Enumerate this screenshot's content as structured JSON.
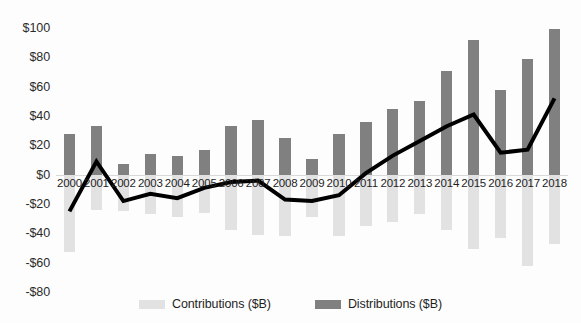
{
  "chart_data": {
    "type": "bar",
    "title": "",
    "xlabel": "",
    "ylabel": "",
    "ylim": [
      -80,
      100
    ],
    "y_ticks": [
      "$100",
      "$80",
      "$60",
      "$40",
      "$20",
      "$0",
      "-$20",
      "-$40",
      "-$60",
      "-$80"
    ],
    "y_tick_values": [
      100,
      80,
      60,
      40,
      20,
      0,
      -20,
      -40,
      -60,
      -80
    ],
    "grid": false,
    "legend_position": "bottom",
    "categories": [
      "2000",
      "2001",
      "2002",
      "2003",
      "2004",
      "2005",
      "2006",
      "2007",
      "2008",
      "2009",
      "2010",
      "2011",
      "2012",
      "2013",
      "2014",
      "2015",
      "2016",
      "2017",
      "2018"
    ],
    "series": [
      {
        "name": "Contributions ($B)",
        "type": "bar",
        "color": "#e2e2e2",
        "values": [
          -53,
          -24,
          -25,
          -27,
          -29,
          -26,
          -38,
          -41,
          -42,
          -29,
          -42,
          -35,
          -32,
          -27,
          -38,
          -51,
          -43,
          -62,
          -47
        ]
      },
      {
        "name": "Distributions ($B)",
        "type": "bar",
        "color": "#808080",
        "values": [
          28,
          33,
          7,
          14,
          13,
          17,
          33,
          37,
          25,
          11,
          28,
          36,
          45,
          50,
          71,
          92,
          58,
          79,
          99
        ]
      },
      {
        "name": "Net ($B)",
        "type": "line",
        "color": "#000000",
        "values": [
          -25,
          9,
          -18,
          -13,
          -16,
          -9,
          -5,
          -4,
          -17,
          -18,
          -14,
          1,
          13,
          23,
          33,
          41,
          15,
          17,
          52
        ]
      }
    ]
  },
  "legend": {
    "items": [
      {
        "label": "Contributions ($B)",
        "color": "#e2e2e2"
      },
      {
        "label": "Distributions ($B)",
        "color": "#808080"
      }
    ]
  },
  "axis": {
    "baseline_color": "#d9d9d9"
  }
}
